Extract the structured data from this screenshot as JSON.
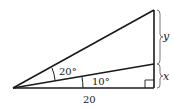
{
  "diagram": {
    "type": "right-triangle-with-cevian",
    "labels": {
      "outer_angle": "20°",
      "inner_angle": "10°",
      "base": "20",
      "upper_segment": "y",
      "lower_segment": "x"
    },
    "colors": {
      "stroke": "#1a1a1a",
      "background": "#ffffff"
    }
  }
}
